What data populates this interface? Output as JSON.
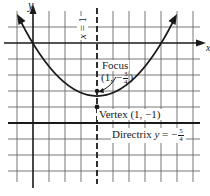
{
  "figure": {
    "type": "parabola-graph",
    "equation_implied": "(x - 1)^2 = y + 1",
    "axes": {
      "x_label": "x",
      "y_label": "y"
    },
    "axis_of_symmetry": {
      "label_lhs": "x",
      "label_eq": "=",
      "label_rhs": "1"
    },
    "focus": {
      "title": "Focus",
      "coord_open": "(1, −",
      "num": "3",
      "den": "4",
      "coord_close": ")"
    },
    "vertex": {
      "text": "Vertex (1, −1)"
    },
    "directrix": {
      "prefix": "Directrix ",
      "var": "y",
      "eq": " = −",
      "num": "5",
      "den": "4"
    },
    "colors": {
      "ink": "#1a1a1a",
      "grid": "#555555",
      "background": "#ffffff"
    }
  }
}
